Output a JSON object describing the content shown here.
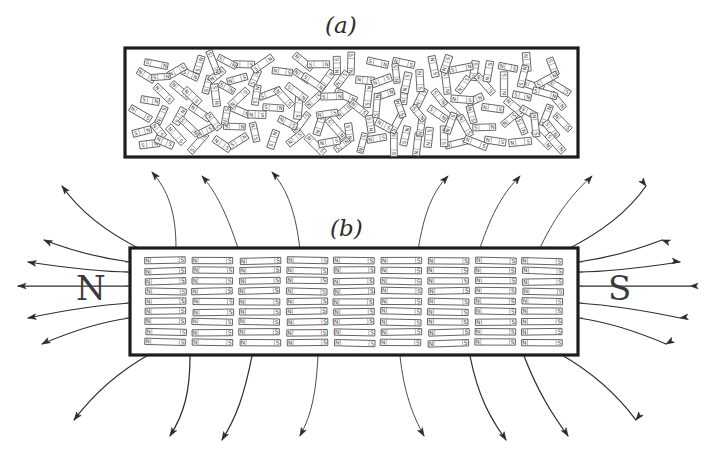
{
  "figure": {
    "title_a": "(a)",
    "title_b": "(b)",
    "pole_left": "N",
    "pole_right": "S",
    "domain_north": "N",
    "domain_south": "S"
  },
  "chart_data": {
    "type": "diagram",
    "panels": [
      {
        "label": "(a)",
        "description": "Unmagnetized: magnetic domains randomly oriented",
        "box": {
          "x": 125,
          "y": 48,
          "w": 453,
          "h": 109
        },
        "domain_count": 140,
        "orientation": "random",
        "external_field": false
      },
      {
        "label": "(b)",
        "description": "Magnetized: magnetic domains aligned, external field lines shown",
        "box": {
          "x": 130,
          "y": 248,
          "w": 448,
          "h": 107
        },
        "domain_count": 117,
        "orientation": "aligned-horizontal",
        "external_field": true,
        "pole_left": "N",
        "pole_right": "S",
        "field_lines": 14
      }
    ],
    "ink_color": "#1c1c1c",
    "background": "#ffffff"
  }
}
